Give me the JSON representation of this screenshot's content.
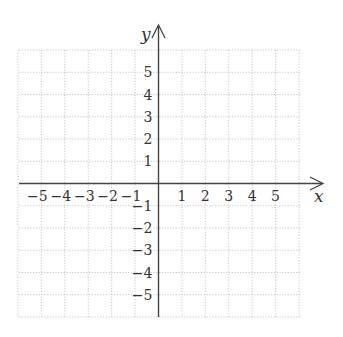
{
  "chart_data": {
    "type": "coordinate_grid",
    "title": "",
    "xlabel": "x",
    "ylabel": "y",
    "xlim": [
      -6,
      6
    ],
    "ylim": [
      -6,
      6
    ],
    "grid": true,
    "grid_style": "dotted",
    "x_tick_labels": [
      "-5",
      "-4",
      "-3",
      "-2",
      "-1",
      "1",
      "2",
      "3",
      "4",
      "5"
    ],
    "y_tick_labels": [
      "5",
      "4",
      "3",
      "2",
      "1",
      "-1",
      "-2",
      "-3",
      "-4",
      "-5"
    ],
    "x_ticks": [
      -5,
      -4,
      -3,
      -2,
      -1,
      1,
      2,
      3,
      4,
      5
    ],
    "y_ticks": [
      5,
      4,
      3,
      2,
      1,
      -1,
      -2,
      -3,
      -4,
      -5
    ],
    "series": []
  },
  "axes": {
    "x_label": "x",
    "y_label": "y"
  },
  "colors": {
    "axis": "#444444",
    "grid": "#b8b8b8",
    "text": "#333333"
  }
}
